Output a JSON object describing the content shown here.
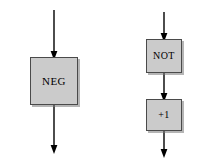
{
  "figure": {
    "type": "block-diagram",
    "background_color": "#ffffff",
    "box_fill_color": "#cbcbcb",
    "box_border_color": "#4a4a4a",
    "line_color": "#000000"
  },
  "left_flow": {
    "name": "neg-flow",
    "input_arrow_label": "",
    "box": {
      "label": "NEG",
      "x": 30,
      "y": 57,
      "width": 48,
      "height": 48
    },
    "output_arrow_label": ""
  },
  "right_flow": {
    "name": "not-plus-one-flow",
    "input_arrow_label": "",
    "boxes": [
      {
        "label": "NOT",
        "x": 146,
        "y": 39,
        "width": 36,
        "height": 34
      },
      {
        "label": "+1",
        "x": 146,
        "y": 99,
        "width": 36,
        "height": 32
      }
    ],
    "output_arrow_label": ""
  }
}
